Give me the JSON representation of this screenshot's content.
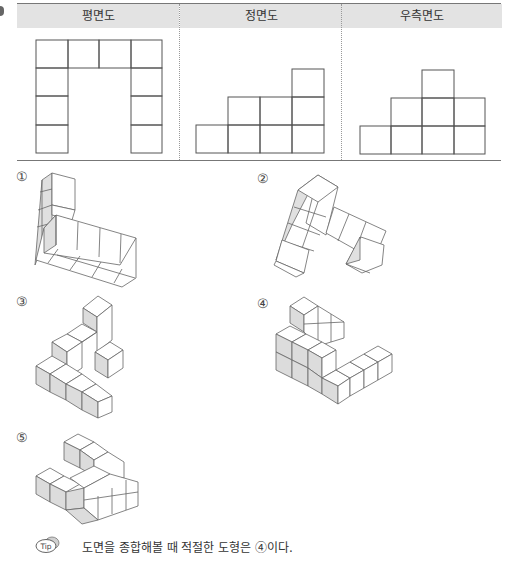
{
  "views": {
    "headers": [
      "평면도",
      "정면도",
      "우측면도"
    ],
    "plan": {
      "label": "평면도",
      "grid": [
        [
          1,
          1,
          1,
          1
        ],
        [
          1,
          0,
          0,
          1
        ],
        [
          1,
          0,
          0,
          1
        ],
        [
          1,
          0,
          0,
          1
        ]
      ]
    },
    "front": {
      "label": "정면도",
      "column_heights": [
        1,
        2,
        2,
        3
      ]
    },
    "right": {
      "label": "우측면도",
      "column_heights": [
        1,
        2,
        3,
        2
      ]
    }
  },
  "options": [
    {
      "num": "①",
      "label": "option 1"
    },
    {
      "num": "②",
      "label": "option 2"
    },
    {
      "num": "③",
      "label": "option 3"
    },
    {
      "num": "④",
      "label": "option 4"
    },
    {
      "num": "⑤",
      "label": "option 5"
    }
  ],
  "tip": {
    "icon": "tip-icon",
    "icon_text": "Tip",
    "text": "도면을 종합해볼 때 적절한 도형은 ④이다."
  },
  "colors": {
    "header_bg": "#e3e3e3",
    "shaded_face": "#dcdcdc",
    "line": "#555555"
  }
}
